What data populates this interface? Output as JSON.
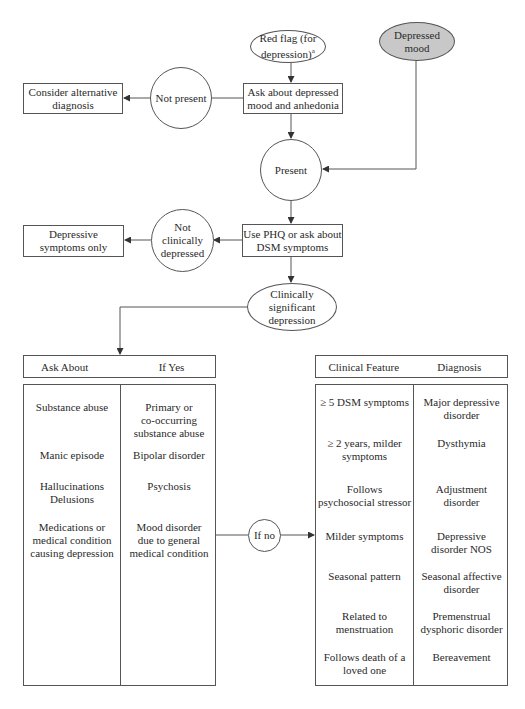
{
  "nodes": {
    "red_flag": "Red flag (for\ndepression)",
    "red_flag_sup": "a",
    "depressed_mood": "Depressed\nmood",
    "ask_mood": "Ask about depressed\nmood and anhedonia",
    "not_present": "Not present",
    "consider_alt": "Consider alternative\ndiagnosis",
    "present": "Present",
    "use_phq": "Use PHQ or ask about\nDSM symptoms",
    "not_clinically": "Not\nclinically\ndepressed",
    "depressive_only": "Depressive\nsymptoms only",
    "clinically_significant": "Clinically\nsignificant\ndepression",
    "if_no": "If no"
  },
  "left_table": {
    "headers": [
      "Ask About",
      "If Yes"
    ],
    "rows": [
      {
        "ask": "Substance abuse",
        "result": "Primary or\nco-occurring\nsubstance abuse"
      },
      {
        "ask": "Manic episode",
        "result": "Bipolar disorder"
      },
      {
        "ask": "Hallucinations\nDelusions",
        "result": "Psychosis"
      },
      {
        "ask": "Medications or\nmedical condition\ncausing depression",
        "result": "Mood disorder\ndue to general\nmedical condition"
      }
    ]
  },
  "right_table": {
    "headers": [
      "Clinical Feature",
      "Diagnosis"
    ],
    "rows": [
      {
        "feature": "≥ 5 DSM symptoms",
        "diagnosis": "Major depressive\ndisorder"
      },
      {
        "feature": "≥ 2 years, milder\nsymptoms",
        "diagnosis": "Dysthymia"
      },
      {
        "feature": "Follows\npsychosocial stressor",
        "diagnosis": "Adjustment\ndisorder"
      },
      {
        "feature": "Milder symptoms",
        "diagnosis": "Depressive\ndisorder NOS"
      },
      {
        "feature": "Seasonal pattern",
        "diagnosis": "Seasonal affective\ndisorder"
      },
      {
        "feature": "Related to\nmenstruation",
        "diagnosis": "Premenstrual\ndysphoric disorder"
      },
      {
        "feature": "Follows death of a\nloved one",
        "diagnosis": "Bereavement"
      }
    ]
  },
  "colors": {
    "line": "#555555",
    "shaded_node": "#c8c8c8",
    "background": "#ffffff"
  }
}
